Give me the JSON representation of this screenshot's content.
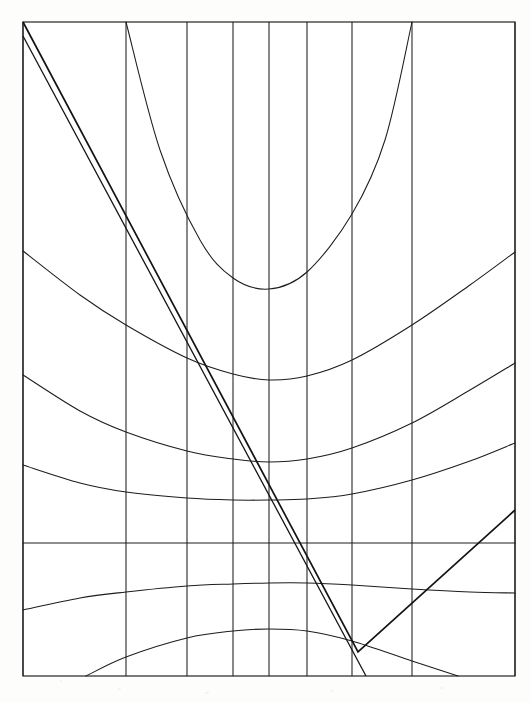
{
  "figure": {
    "background_color": "#ffffff",
    "ink_color": "#1d1d1d",
    "frame": {
      "label": "plot-frame",
      "x0": 23,
      "y0": 22,
      "x1": 515,
      "y1": 676,
      "width": 492,
      "height": 654,
      "stroke": "#1a1a1a"
    }
  },
  "chart_data": {
    "type": "line",
    "xlabel": "",
    "ylabel": "",
    "grid": true,
    "legend": "none",
    "xlim": [
      23,
      515
    ],
    "ylim": [
      676,
      22
    ],
    "axis_note": "pixel coordinates; y increases downward",
    "vertical_gridlines": {
      "name": "vertical-gridlines",
      "count": 9,
      "x_positions": [
        23,
        126,
        187,
        233,
        269,
        307,
        352,
        412,
        515
      ],
      "spacing_note": "non-uniform, tightest near center x=269"
    },
    "horizontal_reference_line": {
      "name": "flat-contour",
      "y": 543,
      "from_x": 23,
      "to_x": 515,
      "curvature": 0
    },
    "contour_curves": [
      {
        "name": "contour-1-upward",
        "orientation": "concave-up",
        "vertex": [
          269,
          289
        ],
        "left_endpoint": [
          126,
          22
        ],
        "right_endpoint": [
          412,
          22
        ],
        "samples_x": [
          126,
          160,
          200,
          233,
          269,
          307,
          352,
          385,
          412
        ],
        "samples_y": [
          22,
          150,
          240,
          278,
          289,
          272,
          214,
          140,
          22
        ]
      },
      {
        "name": "contour-2-upward",
        "orientation": "concave-up",
        "vertex": [
          269,
          380
        ],
        "left_endpoint": [
          23,
          251
        ],
        "right_endpoint": [
          515,
          252
        ],
        "samples_x": [
          23,
          80,
          126,
          187,
          233,
          269,
          307,
          352,
          412,
          470,
          515
        ],
        "samples_y": [
          251,
          295,
          325,
          358,
          374,
          380,
          376,
          360,
          325,
          285,
          252
        ]
      },
      {
        "name": "contour-3-upward",
        "orientation": "concave-up",
        "vertex": [
          269,
          462
        ],
        "left_endpoint": [
          23,
          375
        ],
        "right_endpoint": [
          515,
          363
        ],
        "samples_x": [
          23,
          80,
          126,
          187,
          233,
          269,
          307,
          352,
          412,
          470,
          515
        ],
        "samples_y": [
          375,
          411,
          432,
          451,
          459,
          462,
          459,
          448,
          423,
          390,
          363
        ]
      },
      {
        "name": "contour-4-upward",
        "orientation": "concave-up",
        "vertex": [
          269,
          500
        ],
        "left_endpoint": [
          23,
          465
        ],
        "right_endpoint": [
          515,
          443
        ],
        "samples_x": [
          23,
          80,
          126,
          187,
          233,
          269,
          307,
          352,
          412,
          470,
          515
        ],
        "samples_y": [
          465,
          483,
          492,
          498,
          500,
          500,
          499,
          494,
          480,
          461,
          443
        ]
      },
      {
        "name": "contour-5-flat",
        "orientation": "straight",
        "vertex": [
          269,
          543
        ],
        "left_endpoint": [
          23,
          543
        ],
        "right_endpoint": [
          515,
          543
        ],
        "samples_x": [
          23,
          269,
          515
        ],
        "samples_y": [
          543,
          543,
          543
        ]
      },
      {
        "name": "contour-6-downward",
        "orientation": "concave-down",
        "vertex": [
          269,
          583
        ],
        "left_endpoint": [
          23,
          610
        ],
        "right_endpoint": [
          515,
          593
        ],
        "samples_x": [
          23,
          80,
          126,
          187,
          233,
          269,
          307,
          352,
          412,
          470,
          515
        ],
        "samples_y": [
          610,
          598,
          592,
          586,
          584,
          583,
          583,
          585,
          589,
          592,
          593
        ]
      },
      {
        "name": "contour-7-downward",
        "orientation": "concave-down",
        "vertex": [
          269,
          629
        ],
        "left_endpoint": [
          86,
          676
        ],
        "right_endpoint": [
          458,
          676
        ],
        "samples_x": [
          86,
          126,
          187,
          233,
          269,
          307,
          352,
          412,
          458
        ],
        "samples_y": [
          676,
          657,
          638,
          631,
          629,
          631,
          641,
          661,
          676
        ]
      }
    ],
    "v_graph": {
      "name": "v-shaped-piecewise-line",
      "description": "Descending segment from top-left frame corner to a vertex, then ascending to the right edge",
      "vertex": [
        358,
        652
      ],
      "descending_segment": {
        "start": [
          23,
          22
        ],
        "end": [
          358,
          652
        ],
        "slope_note": "steep negative"
      },
      "ascending_segment": {
        "start": [
          358,
          652
        ],
        "end": [
          515,
          510
        ],
        "slope_note": "positive, shallower"
      }
    },
    "secondary_line": {
      "name": "secant-line",
      "description": "Second straight line starting lower on the left edge, converging with the descending segment",
      "start": [
        23,
        36
      ],
      "end": [
        366,
        676
      ]
    }
  }
}
